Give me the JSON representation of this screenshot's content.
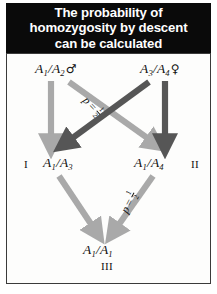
{
  "figure": {
    "title": "The probability of\nhomozygosity by descent\ncan be calculated",
    "colors": {
      "title_background": "#0a0a0a",
      "title_text": "#ffffff",
      "panel_background": "#fdfdfc",
      "panel_border": "#3b3b3b",
      "arrow_light": "#a9a9a9",
      "arrow_dark": "#565656",
      "label_text": "#111111"
    }
  },
  "parents": {
    "father": {
      "allele1": "A",
      "allele1_sub": "1",
      "allele2": "A",
      "allele2_sub": "2",
      "separator": "/",
      "sex_symbol": "♂",
      "sex_name": "male"
    },
    "mother": {
      "allele1": "A",
      "allele1_sub": "3",
      "allele2": "A",
      "allele2_sub": "4",
      "separator": "/",
      "sex_symbol": "♀",
      "sex_name": "female"
    }
  },
  "offspring": {
    "gen1": {
      "roman": "I",
      "allele1": "A",
      "allele1_sub": "1",
      "allele2": "A",
      "allele2_sub": "3",
      "separator": "/"
    },
    "gen2": {
      "roman": "II",
      "allele1": "A",
      "allele1_sub": "1",
      "allele2": "A",
      "allele2_sub": "4",
      "separator": "/"
    },
    "gen3": {
      "roman": "III",
      "allele1": "A",
      "allele1_sub": "1",
      "allele2": "A",
      "allele2_sub": "1",
      "separator": "/"
    }
  },
  "probabilities": {
    "top": {
      "symbol": "p",
      "equals": "=",
      "numerator": "1",
      "denominator": "2"
    },
    "bottom": {
      "symbol": "p",
      "equals": "=",
      "numerator": "1",
      "denominator": "2"
    }
  },
  "arrows": [
    {
      "name": "father-to-gen1-vertical",
      "shade": "light"
    },
    {
      "name": "father-to-gen2-diagonal",
      "shade": "light"
    },
    {
      "name": "mother-to-gen2-vertical",
      "shade": "dark"
    },
    {
      "name": "mother-to-gen1-diagonal",
      "shade": "dark"
    },
    {
      "name": "gen1-to-gen3-diagonal",
      "shade": "light"
    },
    {
      "name": "gen2-to-gen3-diagonal",
      "shade": "light"
    }
  ]
}
